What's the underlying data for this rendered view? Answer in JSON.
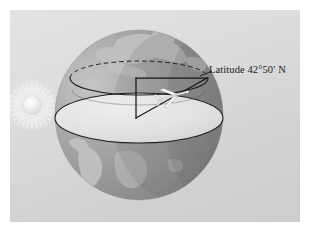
{
  "figure": {
    "panel_background": "#dcdcdc",
    "label": "Latitude 42°50′ N",
    "globe": {
      "ocean_color": "#9a9a9a",
      "land_color": "#c4c4c4",
      "cut_plane_color": "#e4e4e4",
      "outline_color": "#1b1b1b",
      "center_x": 139,
      "center_y": 115,
      "radius_x": 84,
      "radius_y": 85
    },
    "sun": {
      "name": "sun",
      "center_x": 32,
      "center_y": 105,
      "core_radius": 9,
      "ray_count": 28,
      "color": "#f2f2f2"
    },
    "latitude_circle": {
      "style": "dashed",
      "center_x": 139,
      "center_y": 78,
      "radius_x": 69,
      "radius_y": 17
    },
    "equator_plane": {
      "style": "solid",
      "center_x": 139,
      "center_y": 118,
      "radius_x": 84,
      "radius_y": 25
    },
    "angle_wedge": {
      "apex_x": 136,
      "apex_y": 118,
      "vertical_top_y": 78,
      "horizontal_end_x": 207,
      "stroke": "#1b1b1b"
    },
    "airplane": {
      "name": "airplane",
      "x": 174,
      "y": 95,
      "color": "#f5f5f5"
    },
    "values": {
      "latitude_degrees": 42,
      "latitude_minutes": 50,
      "hemisphere": "N"
    }
  }
}
